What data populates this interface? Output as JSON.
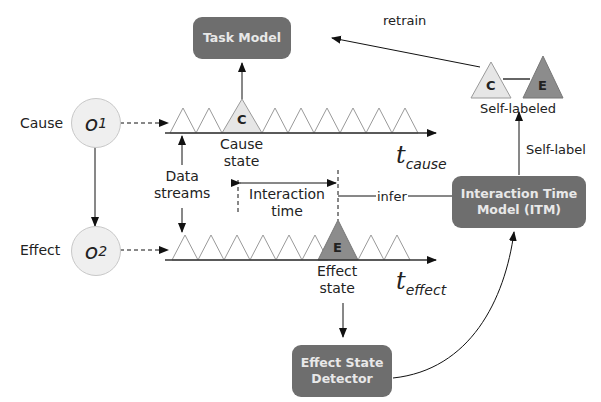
{
  "boxes": {
    "task_model": "Task Model",
    "itm_line1": "Interaction Time",
    "itm_line2": "Model (ITM)",
    "detector_line1": "Effect State",
    "detector_line2": "Detector"
  },
  "nodes": {
    "cause_label": "Cause",
    "effect_label": "Effect",
    "o1": "o",
    "o1_sub": "1",
    "o2": "o",
    "o2_sub": "2"
  },
  "axes": {
    "cause_t": "t",
    "cause_sub": "cause",
    "effect_t": "t",
    "effect_sub": "effect"
  },
  "labels": {
    "cause_state_1": "Cause",
    "cause_state_2": "state",
    "effect_state_1": "Effect",
    "effect_state_2": "state",
    "data_streams_1": "Data",
    "data_streams_2": "streams",
    "interaction_1": "Interaction",
    "interaction_2": "time",
    "infer": "infer",
    "retrain": "retrain",
    "self_label": "Self-label",
    "self_labeled": "Self-labeled"
  },
  "triangles": {
    "cause_marker": "C",
    "effect_marker": "E",
    "self_c": "C",
    "self_e": "E"
  },
  "colors": {
    "box_fill": "#6e6e6e",
    "box_text": "#e8e8e8",
    "cause_tri": "#e6e6e6",
    "effect_tri": "#8c8c8c",
    "node_fill": "#efefef"
  }
}
